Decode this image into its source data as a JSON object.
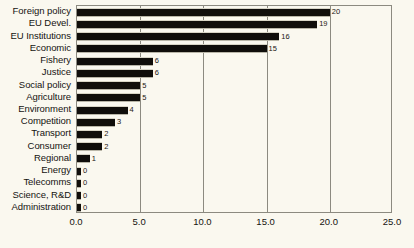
{
  "chart_data": {
    "type": "bar",
    "orientation": "horizontal",
    "title": "",
    "subtitle": "",
    "xlabel": "",
    "ylabel": "",
    "xlim": [
      0,
      25
    ],
    "ylim": null,
    "grid": true,
    "legend": null,
    "legend_position": "none",
    "xticks": [
      "0.0",
      "5.0",
      "10.0",
      "15.0",
      "20.0",
      "25.0"
    ],
    "xtick_values": [
      0,
      5,
      10,
      15,
      20,
      25
    ],
    "categories": [
      "Foreign policy",
      "EU Devel.",
      "EU Institutions",
      "Economic",
      "Fishery",
      "Justice",
      "Social  policy",
      "Agriculture",
      "Environment",
      "Competition",
      "Transport",
      "Consumer",
      "Regional",
      "Energy",
      "Telecomms",
      "Science, R&D",
      "Administration"
    ],
    "values": [
      20,
      19,
      16,
      15,
      6,
      6,
      5,
      5,
      4,
      3,
      2,
      2,
      1,
      0,
      0,
      0,
      0
    ],
    "value_labels": [
      "20",
      "19",
      "16",
      "15",
      "6",
      "6",
      "5",
      "5",
      "4",
      "3",
      "2",
      "2",
      "1",
      "0",
      "0",
      "0",
      "0"
    ],
    "bar_color": "#100e0b",
    "background_color": "#faf8ef",
    "axis_color": "#8c8a80",
    "text_color": "#151310"
  }
}
